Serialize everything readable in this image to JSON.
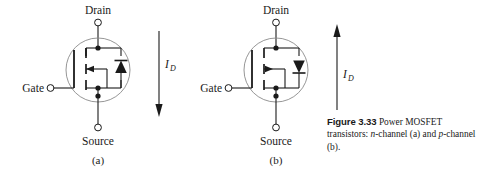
{
  "figure": {
    "number_label": "Figure 3.33",
    "caption_text_1": "Power MOSFET",
    "caption_text_2": "transistors: ",
    "caption_italic_1": "n",
    "caption_text_3": "-channel (a) and",
    "caption_italic_2": "p",
    "caption_text_4": "-channel (b)."
  },
  "devices": [
    {
      "id": "n-channel",
      "sub_label": "(a)",
      "drain_label": "Drain",
      "source_label": "Source",
      "gate_label": "Gate",
      "current_symbol": "I",
      "current_subscript": "D",
      "current_direction": "down",
      "diode_direction": "up",
      "channel_arrow_direction": "left"
    },
    {
      "id": "p-channel",
      "sub_label": "(b)",
      "drain_label": "Drain",
      "source_label": "Source",
      "gate_label": "Gate",
      "current_symbol": "I",
      "current_subscript": "D",
      "current_direction": "up",
      "diode_direction": "down",
      "channel_arrow_direction": "right"
    }
  ],
  "style": {
    "line_color": "#1a1a1a",
    "background": "#ffffff",
    "terminal_fill": "#ffffff"
  }
}
